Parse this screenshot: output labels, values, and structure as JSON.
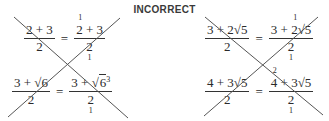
{
  "title": "INCORRECT",
  "examples": [
    {
      "lhs_num": "2 + 3",
      "lhs_den": "2",
      "rhs_num_a": "2",
      "rhs_num_b": " + 3",
      "rhs_den": "2",
      "cancel_top": "1",
      "cancel_bottom": "1"
    },
    {
      "lhs_num": "3 + 2√5",
      "lhs_den": "2",
      "rhs_num_a": "3 + ",
      "rhs_num_b": "2√5",
      "rhs_den": "2",
      "cancel_top": "1",
      "cancel_bottom": "1"
    },
    {
      "lhs_num": "3 + √6",
      "lhs_den": "2",
      "rhs_num_a": "3 + √",
      "rhs_num_b": "6",
      "rhs_exp": "3",
      "rhs_den": "2",
      "cancel_bottom": "1"
    },
    {
      "lhs_num": "4 + 3√5",
      "lhs_den": "2",
      "rhs_num_a": "4",
      "rhs_num_b": " + 3√5",
      "rhs_den": "2",
      "cancel_top": "2",
      "cancel_bottom": "1"
    }
  ],
  "colors": {
    "strike": "#555555"
  }
}
